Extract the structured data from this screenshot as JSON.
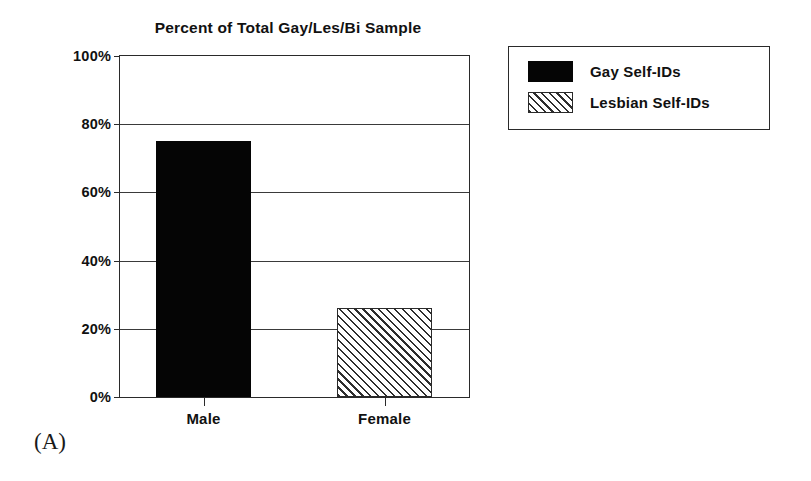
{
  "figure": {
    "panel_caption": "(A)"
  },
  "chart_data": {
    "type": "bar",
    "title": "Percent of Total Gay/Les/Bi Sample",
    "xlabel": "",
    "ylabel": "",
    "categories": [
      "Male",
      "Female"
    ],
    "values": [
      75,
      26
    ],
    "series": [
      {
        "name": "Gay Self-IDs",
        "category": "Male",
        "value": 75,
        "fill": "solid-black"
      },
      {
        "name": "Lesbian Self-IDs",
        "category": "Female",
        "value": 26,
        "fill": "diagonal-hatch"
      }
    ],
    "ylim": [
      0,
      100
    ],
    "y_ticks": [
      0,
      20,
      40,
      60,
      80,
      100
    ],
    "y_tick_labels": [
      "0%",
      "20%",
      "40%",
      "60%",
      "80%",
      "100%"
    ],
    "grid": true,
    "grid_axis": "y",
    "legend_position": "right-outside",
    "legend": [
      {
        "label": "Gay Self-IDs",
        "swatch": "solid"
      },
      {
        "label": "Lesbian Self-IDs",
        "swatch": "hatch"
      }
    ],
    "colors": {
      "bar_solid": "#050505",
      "bar_hatch_line": "#2e2e2e",
      "axis": "#2a2a2a",
      "background": "#ffffff",
      "text": "#111111"
    }
  }
}
